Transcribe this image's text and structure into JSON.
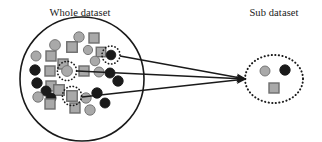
{
  "figure": {
    "name": "dataset-sampling-diagram",
    "background": "#ffffff",
    "width": 322,
    "height": 142
  },
  "labels": {
    "whole_dataset": "Whole dataset",
    "sub_dataset": "Sub dataset"
  },
  "colors": {
    "outline": "#1a1a1a",
    "gray_fill": "#a9a9a9",
    "gray_stroke": "#6e6e6e",
    "black_fill": "#1a1a1a",
    "dotted_ring": "#1a1a1a",
    "arrow": "#1a1a1a",
    "background": "#ffffff"
  },
  "whole_dataset": {
    "circle": {
      "cx": 82,
      "cy": 79,
      "r": 62,
      "stroke_width": 1.6
    },
    "label_pos": {
      "x": 80,
      "y": 16
    },
    "shapes": [
      {
        "id": "c1",
        "type": "circle",
        "fill": "gray",
        "cx": 79,
        "cy": 37,
        "r": 5.2
      },
      {
        "id": "s1",
        "type": "square",
        "fill": "gray",
        "cx": 94,
        "cy": 38,
        "size": 10
      },
      {
        "id": "c2",
        "type": "circle",
        "fill": "gray",
        "cx": 55,
        "cy": 45,
        "r": 5.4
      },
      {
        "id": "s2",
        "type": "square",
        "fill": "gray",
        "cx": 72,
        "cy": 47,
        "size": 10.5
      },
      {
        "id": "c3",
        "type": "circle",
        "fill": "gray",
        "cx": 88,
        "cy": 50,
        "r": 4.6
      },
      {
        "id": "s3",
        "type": "square",
        "fill": "gray",
        "cx": 101,
        "cy": 52,
        "size": 9.5
      },
      {
        "id": "c4",
        "type": "circle",
        "fill": "gray",
        "cx": 36,
        "cy": 56,
        "r": 5.0
      },
      {
        "id": "s4",
        "type": "square",
        "fill": "gray",
        "cx": 51,
        "cy": 56,
        "size": 10
      },
      {
        "id": "c5",
        "type": "circle",
        "fill": "gray",
        "cx": 95,
        "cy": 61,
        "r": 4.8
      },
      {
        "id": "s5",
        "type": "square",
        "fill": "gray",
        "cx": 63,
        "cy": 64,
        "size": 10
      },
      {
        "id": "c6",
        "type": "circle",
        "fill": "black",
        "cx": 35,
        "cy": 70,
        "r": 5.2
      },
      {
        "id": "s6",
        "type": "square",
        "fill": "gray",
        "cx": 50,
        "cy": 71,
        "size": 10
      },
      {
        "id": "s7",
        "type": "square",
        "fill": "gray",
        "cx": 84,
        "cy": 71,
        "size": 10
      },
      {
        "id": "c7",
        "type": "circle",
        "fill": "gray",
        "cx": 99,
        "cy": 72,
        "r": 5.0
      },
      {
        "id": "c8",
        "type": "circle",
        "fill": "black",
        "cx": 110,
        "cy": 73,
        "r": 5.0
      },
      {
        "id": "c9",
        "type": "circle",
        "fill": "black",
        "cx": 37,
        "cy": 83,
        "r": 5.2
      },
      {
        "id": "c10",
        "type": "circle",
        "fill": "black",
        "cx": 118,
        "cy": 81,
        "r": 5.2
      },
      {
        "id": "s8",
        "type": "square",
        "fill": "gray",
        "cx": 51,
        "cy": 86,
        "size": 10
      },
      {
        "id": "c11",
        "type": "circle",
        "fill": "black",
        "cx": 46,
        "cy": 91,
        "r": 5.0
      },
      {
        "id": "s9",
        "type": "square",
        "fill": "gray",
        "cx": 59,
        "cy": 90,
        "size": 10.5
      },
      {
        "id": "c12",
        "type": "circle",
        "fill": "gray",
        "cx": 38,
        "cy": 97,
        "r": 5.2
      },
      {
        "id": "c13",
        "type": "circle",
        "fill": "black",
        "cx": 51,
        "cy": 98,
        "r": 5.0
      },
      {
        "id": "c14",
        "type": "circle",
        "fill": "black",
        "cx": 97,
        "cy": 93,
        "r": 5.2
      },
      {
        "id": "c15",
        "type": "circle",
        "fill": "gray",
        "cx": 86,
        "cy": 98,
        "r": 5.2
      },
      {
        "id": "c16",
        "type": "circle",
        "fill": "black",
        "cx": 105,
        "cy": 103,
        "r": 5.0
      },
      {
        "id": "s10",
        "type": "square",
        "fill": "gray",
        "cx": 50,
        "cy": 104,
        "size": 10
      },
      {
        "id": "s11",
        "type": "square",
        "fill": "gray",
        "cx": 75,
        "cy": 108,
        "size": 10
      },
      {
        "id": "c17",
        "type": "circle",
        "fill": "gray",
        "cx": 90,
        "cy": 110,
        "r": 5.2
      }
    ],
    "highlighted": [
      {
        "id": "h1",
        "type": "circle",
        "fill": "black",
        "cx": 111,
        "cy": 55,
        "r": 4.8,
        "ring_r": 9.0
      },
      {
        "id": "h2",
        "type": "circle",
        "fill": "gray",
        "cx": 67,
        "cy": 71,
        "r": 5.4,
        "ring_r": 9.6
      },
      {
        "id": "h3",
        "type": "square",
        "fill": "gray",
        "cx": 72,
        "cy": 96,
        "size": 10.5,
        "ring_r": 9.6
      }
    ]
  },
  "sub_dataset": {
    "ellipse": {
      "cx": 274,
      "cy": 79,
      "rx": 29,
      "ry": 24
    },
    "label_pos": {
      "x": 274,
      "y": 16
    },
    "shapes": [
      {
        "id": "sc1",
        "type": "circle",
        "fill": "gray",
        "cx": 265,
        "cy": 71,
        "r": 5.0
      },
      {
        "id": "sc2",
        "type": "circle",
        "fill": "black",
        "cx": 285,
        "cy": 70,
        "r": 5.2
      },
      {
        "id": "ss1",
        "type": "square",
        "fill": "gray",
        "cx": 274,
        "cy": 88,
        "size": 10
      }
    ]
  },
  "arrows": [
    {
      "id": "a1",
      "from": {
        "x": 120,
        "y": 56
      },
      "to": {
        "x": 246,
        "y": 79
      }
    },
    {
      "id": "a2",
      "from": {
        "x": 77,
        "y": 71
      },
      "to": {
        "x": 246,
        "y": 79
      }
    },
    {
      "id": "a3",
      "from": {
        "x": 82,
        "y": 97
      },
      "to": {
        "x": 246,
        "y": 79
      }
    }
  ]
}
